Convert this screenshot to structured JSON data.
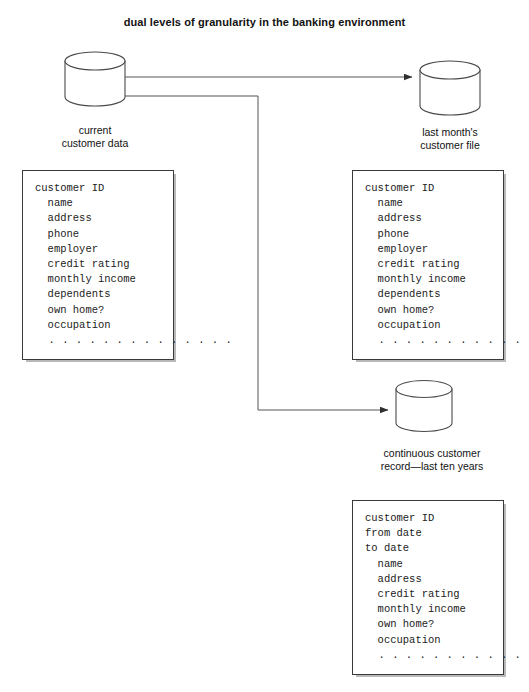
{
  "title": "dual levels of granularity in the banking environment",
  "nodes": {
    "current": {
      "icon": "database-cylinder",
      "label_line1": "current",
      "label_line2": "customer data"
    },
    "last_month": {
      "icon": "database-cylinder",
      "label_line1": "last month's",
      "label_line2": "customer file"
    },
    "continuous": {
      "icon": "database-cylinder",
      "label_line1": "continuous customer",
      "label_line2": "record—last ten years"
    }
  },
  "boxes": {
    "current_fields": {
      "rows": [
        "customer ID",
        "  name",
        "  address",
        "  phone",
        "  employer",
        "  credit rating",
        "  monthly income",
        "  dependents",
        "  own home?",
        "  occupation",
        "  . . . . . . . . . . . . . ."
      ]
    },
    "last_month_fields": {
      "rows": [
        "customer ID",
        "  name",
        "  address",
        "  phone",
        "  employer",
        "  credit rating",
        "  monthly income",
        "  dependents",
        "  own home?",
        "  occupation",
        "  . . . . . . . . . . . . . ."
      ]
    },
    "continuous_fields": {
      "rows": [
        "customer ID",
        "from date",
        "to date",
        "  name",
        "  address",
        "  credit rating",
        "  monthly income",
        "  own home?",
        "  occupation",
        "  . . . . . . . . . . . . . ."
      ]
    }
  },
  "connectors": [
    {
      "name": "current-to-last-month",
      "from": "current",
      "to": "last_month",
      "style": "arrow"
    },
    {
      "name": "current-to-continuous",
      "from": "current",
      "to": "continuous",
      "style": "arrow-elbow"
    }
  ],
  "colors": {
    "stroke": "#3a3a3a",
    "background": "#ffffff",
    "shadow": "#b9b9b9",
    "text": "#111111"
  }
}
